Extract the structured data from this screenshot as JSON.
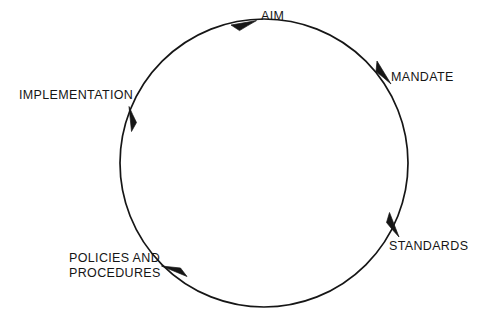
{
  "diagram": {
    "type": "cycle",
    "title": "",
    "background_color": "#ffffff",
    "stroke_color": "#161616",
    "text_color": "#151515",
    "circle": {
      "center_x": 264,
      "center_y": 163,
      "radius": 144
    },
    "direction": "clockwise",
    "stages": [
      {
        "id": "aim",
        "label": "AIM",
        "angle_deg": 90,
        "position": "top",
        "has_arrowhead": true,
        "arrow_angle_deg": 100
      },
      {
        "id": "mandate",
        "label": "MANDATE",
        "angle_deg": 45,
        "position": "upper-right",
        "has_arrowhead": true,
        "arrow_angle_deg": 52
      },
      {
        "id": "standards",
        "label": "STANDARDS",
        "angle_deg": 340,
        "position": "lower-right",
        "has_arrowhead": true,
        "arrow_angle_deg": 335
      },
      {
        "id": "policies-and-procedures",
        "label": "POLICIES AND\nPROCEDURES",
        "label_line_1": "POLICIES AND",
        "label_line_2": "PROCEDURES",
        "angle_deg": 226,
        "position": "lower-left",
        "has_arrowhead": true,
        "arrow_angle_deg": 222
      },
      {
        "id": "implementation",
        "label": "IMPLEMENTATION",
        "angle_deg": 152,
        "position": "upper-left",
        "has_arrowhead": true,
        "arrow_angle_deg": 150
      }
    ]
  }
}
